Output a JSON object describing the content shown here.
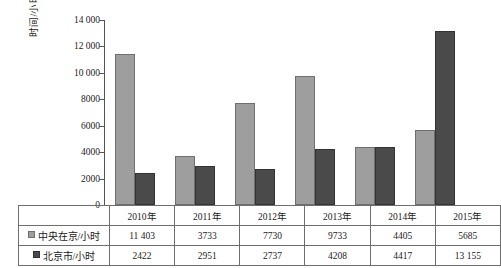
{
  "chart_data": {
    "type": "bar",
    "title": "",
    "xlabel": "",
    "ylabel": "时间/小时",
    "ylim": [
      0,
      14000
    ],
    "yticks": [
      "0",
      "2000",
      "4000",
      "6000",
      "8000",
      "10 000",
      "12 000",
      "14 000"
    ],
    "ytick_values": [
      0,
      2000,
      4000,
      6000,
      8000,
      10000,
      12000,
      14000
    ],
    "grid": false,
    "legend_position": "table-row-labels",
    "categories": [
      "2010年",
      "2011年",
      "2012年",
      "2013年",
      "2014年",
      "2015年"
    ],
    "series": [
      {
        "name": "中央在京/小时",
        "color": "#9e9e9e",
        "values": [
          11403,
          3733,
          7730,
          9733,
          4405,
          5685
        ],
        "labels": [
          "11 403",
          "3733",
          "7730",
          "9733",
          "4405",
          "5685"
        ]
      },
      {
        "name": "北京市/小时",
        "color": "#4a4a4a",
        "values": [
          2422,
          2951,
          2737,
          4208,
          4417,
          13155
        ],
        "labels": [
          "2422",
          "2951",
          "2737",
          "4208",
          "4417",
          "13 155"
        ]
      }
    ]
  },
  "table": {
    "blank_corner": "",
    "row_header_col_width": 86
  },
  "colors": {
    "series_light": "#9e9e9e",
    "series_dark": "#4a4a4a",
    "axis": "#555555",
    "border": "#6e6e6e",
    "text": "#1a1a1a",
    "background": "#ffffff"
  }
}
